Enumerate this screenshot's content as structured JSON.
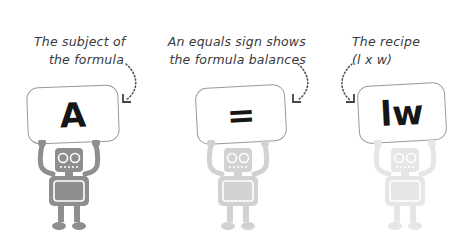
{
  "diagram": {
    "parts": [
      {
        "caption": [
          "The subject of",
          "the formula"
        ],
        "symbol": "A",
        "robot_shade": "#8e8e8e"
      },
      {
        "caption": [
          "An equals sign shows",
          "the formula balances"
        ],
        "symbol": "=",
        "robot_shade": "#d2d2d2"
      },
      {
        "caption": [
          "The recipe",
          "(l x w)"
        ],
        "symbol": "lw",
        "robot_shade": "#e6e6e6"
      }
    ],
    "colors": {
      "text": "#3a3a3a",
      "card_border": "#9a9a9a",
      "symbol": "#161616",
      "background": "#ffffff"
    }
  }
}
